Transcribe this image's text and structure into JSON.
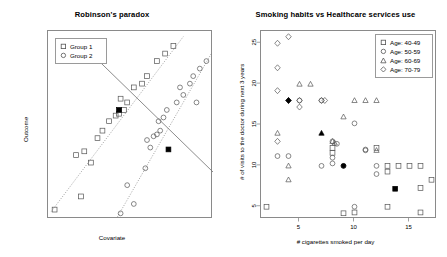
{
  "figure": {
    "background": "#ffffff",
    "marker_color": "#555555",
    "highlight_color": "#000000",
    "line_color": "#777777"
  },
  "panels": [
    {
      "id": "robinsons-paradox",
      "title": "Robinson's paradox",
      "xlabel": "Covariate",
      "ylabel": "Outcome",
      "legend": {
        "items": [
          {
            "label": "Group 1",
            "marker": "square"
          },
          {
            "label": "Group 2",
            "marker": "circle"
          }
        ]
      }
    },
    {
      "id": "smoking-healthcare",
      "title": "Smoking habits vs Healthcare services use",
      "xlabel": "# cigarettes smoked per day",
      "ylabel": "# of visits to the doctor during next 3 years",
      "legend": {
        "items": [
          {
            "label": "Age: 40-49",
            "marker": "square"
          },
          {
            "label": "Age: 50-59",
            "marker": "circle"
          },
          {
            "label": "Age: 60-69",
            "marker": "triangle"
          },
          {
            "label": "Age: 70-79",
            "marker": "diamond"
          }
        ]
      }
    }
  ],
  "chart_data": [
    {
      "type": "scatter",
      "id": "robinsons-paradox",
      "title": "Robinson's paradox",
      "xlabel": "Covariate",
      "ylabel": "Outcome",
      "xlim": [
        0,
        100
      ],
      "ylim": [
        0,
        100
      ],
      "grid": false,
      "axis_ticks": false,
      "legend_position": "top-left",
      "annotation": "Within-group trends slope upward while the pooled trend slopes downward (ecological fallacy).",
      "series": [
        {
          "name": "Group 1",
          "marker": "square",
          "points": [
            [
              4,
              5
            ],
            [
              20,
              12
            ],
            [
              26,
              30
            ],
            [
              17,
              34
            ],
            [
              22,
              36
            ],
            [
              30,
              43
            ],
            [
              33,
              47
            ],
            [
              37,
              52
            ],
            [
              41,
              55
            ],
            [
              43,
              56
            ],
            [
              46,
              58
            ],
            [
              48,
              62
            ],
            [
              44,
              64
            ],
            [
              52,
              70
            ],
            [
              57,
              72
            ],
            [
              60,
              76
            ],
            [
              66,
              84
            ],
            [
              71,
              88
            ],
            [
              76,
              92
            ]
          ]
        },
        {
          "name": "Group 2",
          "marker": "circle",
          "points": [
            [
              44,
              3
            ],
            [
              52,
              8
            ],
            [
              48,
              18
            ],
            [
              59,
              27
            ],
            [
              62,
              38
            ],
            [
              60,
              42
            ],
            [
              64,
              44
            ],
            [
              66,
              45
            ],
            [
              68,
              47
            ],
            [
              67,
              52
            ],
            [
              70,
              54
            ],
            [
              72,
              58
            ],
            [
              78,
              62
            ],
            [
              82,
              66
            ],
            [
              80,
              70
            ],
            [
              86,
              72
            ],
            [
              88,
              76
            ],
            [
              92,
              80
            ],
            [
              90,
              62
            ],
            [
              96,
              84
            ]
          ]
        }
      ],
      "fit_lines": [
        {
          "name": "Group 1 trend",
          "style": "dotted",
          "from": [
            2,
            4
          ],
          "to": [
            82,
            97
          ]
        },
        {
          "name": "Group 2 trend",
          "style": "dotted",
          "from": [
            42,
            1
          ],
          "to": [
            99,
            88
          ]
        },
        {
          "name": "Pooled trend",
          "style": "solid",
          "from": [
            18,
            95
          ],
          "to": [
            100,
            25
          ]
        }
      ],
      "highlighted_points": [
        {
          "x": 43,
          "y": 58,
          "label": "Group 1 mean"
        },
        {
          "x": 73,
          "y": 37,
          "label": "Group 2 mean"
        }
      ]
    },
    {
      "type": "scatter",
      "id": "smoking-healthcare",
      "title": "Smoking habits vs Healthcare services use",
      "xlabel": "# cigarettes smoked per day",
      "ylabel": "# of visits to the doctor during next 3 years",
      "xlim": [
        1.5,
        17.5
      ],
      "ylim": [
        3.5,
        26.5
      ],
      "xticks": [
        5,
        10,
        15
      ],
      "yticks": [
        5,
        10,
        15,
        20,
        25
      ],
      "grid": false,
      "legend_position": "top-right",
      "annotation": "Overall trend is negative, but within each age group more cigarettes means more visits.",
      "series": [
        {
          "name": "Age: 40-49",
          "marker": "square",
          "points": [
            [
              2,
              5
            ],
            [
              9,
              4.2
            ],
            [
              10,
              4.3
            ],
            [
              13,
              5
            ],
            [
              13,
              9.3
            ],
            [
              13,
              10
            ],
            [
              14,
              10
            ],
            [
              15,
              10
            ],
            [
              16,
              10
            ],
            [
              16,
              7.3
            ],
            [
              16,
              4.3
            ],
            [
              17,
              8.3
            ],
            [
              12,
              12.2
            ],
            [
              8,
              12.2
            ],
            [
              8,
              11.6
            ]
          ]
        },
        {
          "name": "Age: 50-59",
          "marker": "circle",
          "points": [
            [
              3,
              11.2
            ],
            [
              4,
              11.2
            ],
            [
              7,
              10
            ],
            [
              8,
              10.3
            ],
            [
              8,
              11
            ],
            [
              9,
              10
            ],
            [
              10,
              5
            ],
            [
              10,
              15.2
            ],
            [
              11,
              12
            ],
            [
              11,
              11.9
            ],
            [
              12,
              10
            ],
            [
              12,
              9
            ],
            [
              8,
              13
            ],
            [
              8.4,
              12.7
            ],
            [
              5,
              18
            ],
            [
              7,
              18
            ]
          ]
        },
        {
          "name": "Age: 60-69",
          "marker": "triangle",
          "points": [
            [
              3,
              14
            ],
            [
              4,
              10
            ],
            [
              4,
              8.3
            ],
            [
              5,
              20
            ],
            [
              6,
              20
            ],
            [
              8,
              13
            ],
            [
              8.2,
              12.8
            ],
            [
              9,
              16
            ],
            [
              10,
              18
            ],
            [
              11,
              18
            ],
            [
              12,
              18
            ],
            [
              12,
              11.9
            ]
          ]
        },
        {
          "name": "Age: 70-79",
          "marker": "diamond",
          "points": [
            [
              3,
              25
            ],
            [
              4,
              25.8
            ],
            [
              3,
              22
            ],
            [
              3,
              19.2
            ],
            [
              3,
              13
            ],
            [
              4,
              18
            ],
            [
              5,
              18
            ],
            [
              5,
              17.2
            ],
            [
              7,
              18
            ],
            [
              7.3,
              18
            ]
          ]
        }
      ],
      "highlighted_points": [
        {
          "x": 4,
          "y": 18,
          "label": "Age 70-79 mean"
        },
        {
          "x": 7,
          "y": 14,
          "label": "Age 60-69 mean"
        },
        {
          "x": 9,
          "y": 10,
          "label": "Age 50-59 mean"
        },
        {
          "x": 13.7,
          "y": 7.2,
          "label": "Age 40-49 mean"
        }
      ]
    }
  ]
}
